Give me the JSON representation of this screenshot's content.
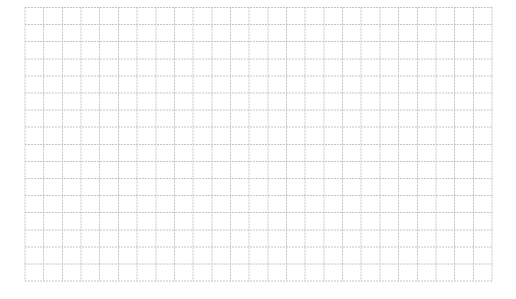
{
  "grid": {
    "left": 25,
    "top": 7.5,
    "columns": 25,
    "rows": 16,
    "cell_width": 18.68,
    "cell_height": 17.1,
    "line_color": "#b8b8b8",
    "line_style": "dashed",
    "background": "#ffffff"
  }
}
